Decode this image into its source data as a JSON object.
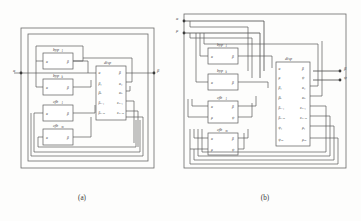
{
  "figure": {
    "caption_a": "(a)",
    "caption_b": "(b)",
    "block_names": {
      "disp": "disp",
      "byp1": "byp",
      "byp1_sub": "1",
      "bypk": "byp",
      "bypk_sub": "k",
      "cfb1": "cfb",
      "cfb1_sub": "1",
      "cfbm": "cfb",
      "cfbm_sub": "m"
    }
  },
  "panel_a": {
    "label": "(a)",
    "input_terminal": "α",
    "output_terminal": "β",
    "disp": {
      "title": "disp",
      "left_ports": [
        "α",
        "β₁",
        "βₖ",
        "βₖ₊₁",
        "βₖ₊ₘ"
      ],
      "right_ports": [
        "β",
        "α₁",
        "αₖ",
        "αₖ₊₁",
        "αₖ₊ₘ"
      ]
    },
    "blocks": [
      {
        "name": "byp",
        "sub": "1",
        "ports_left": [
          "α"
        ],
        "ports_right": [
          "β"
        ]
      },
      {
        "name": "byp",
        "sub": "k",
        "ports_left": [
          "α"
        ],
        "ports_right": [
          "β"
        ]
      },
      {
        "name": "cfb",
        "sub": "1",
        "ports_left": [
          "α"
        ],
        "ports_right": [
          "β"
        ]
      },
      {
        "name": "cfb",
        "sub": "m",
        "ports_left": [
          "α"
        ],
        "ports_right": [
          "β"
        ]
      }
    ]
  },
  "panel_b": {
    "label": "(b)",
    "input_terminals": [
      "α",
      "μ"
    ],
    "output_terminals": [
      "β",
      "ψ"
    ],
    "disp": {
      "title": "disp",
      "left_ports": [
        "α",
        "μ",
        "β₁",
        "βₖ",
        "βₖ₊₁",
        "βₖ₊ₘ",
        "ψ₁",
        "ψₘ"
      ],
      "right_ports": [
        "β",
        "ψ",
        "α₁",
        "αₖ",
        "αₖ₊₁",
        "αₖ₊ₘ",
        "μ₁",
        "μₘ"
      ]
    },
    "blocks": [
      {
        "name": "byp",
        "sub": "1",
        "ports_left": [
          "α"
        ],
        "ports_right": [
          "β"
        ]
      },
      {
        "name": "byp",
        "sub": "k",
        "ports_left": [
          "α"
        ],
        "ports_right": [
          "β"
        ]
      },
      {
        "name": "cfb",
        "sub": "1",
        "ports_left": [
          "α",
          "μ"
        ],
        "ports_right": [
          "β",
          "ψ"
        ]
      },
      {
        "name": "cfb",
        "sub": "m",
        "ports_left": [
          "α",
          "μ"
        ],
        "ports_right": [
          "β",
          "ψ"
        ]
      }
    ]
  }
}
